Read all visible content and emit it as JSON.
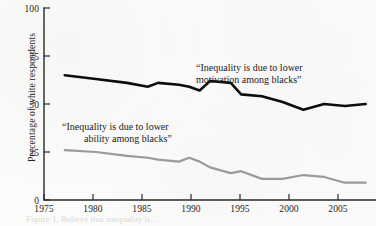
{
  "figure": {
    "ylabel": "Percentage of white respondents",
    "caption": "Figure 1. Believe that inequality is..."
  },
  "chart_data": {
    "type": "line",
    "title": "",
    "xlabel": "",
    "ylabel": "Percentage of white respondents",
    "xlim": [
      1975,
      2007
    ],
    "ylim": [
      0,
      100
    ],
    "grid": false,
    "legend_position": "inline-annotation",
    "xticks": [
      1975,
      1980,
      1985,
      1990,
      1995,
      2000,
      2005
    ],
    "xtick_labels": [
      "1975",
      "1980",
      "1985",
      "1990",
      "1995",
      "2000",
      "2005"
    ],
    "yticks": [
      0,
      25,
      50,
      75,
      100
    ],
    "ytick_labels": [
      "0",
      "25",
      "50",
      "75",
      "100"
    ],
    "series": [
      {
        "name": "“Inequality is due to lower motivation among blacks”",
        "annotation": "“Inequality is due to lower\nmotivation among blacks”",
        "color": "#0d0d0d",
        "width": 2.6,
        "x": [
          1977,
          1980,
          1983,
          1985,
          1986,
          1988,
          1989,
          1990,
          1991,
          1993,
          1994,
          1996,
          1998,
          2000,
          2002,
          2004,
          2006
        ],
        "y": [
          65,
          63,
          61,
          59,
          61,
          60,
          59,
          57,
          62,
          61,
          55,
          54,
          51,
          47,
          50,
          49,
          50
        ]
      },
      {
        "name": "“Inequality is due to lower ability among blacks”",
        "annotation": "“Inequality is due to lower\nability among blacks”",
        "color": "#9a9a9a",
        "width": 2.2,
        "x": [
          1977,
          1980,
          1983,
          1985,
          1986,
          1988,
          1989,
          1990,
          1991,
          1993,
          1994,
          1996,
          1998,
          2000,
          2002,
          2004,
          2006
        ],
        "y": [
          26,
          25,
          23,
          22,
          21,
          20,
          22,
          20,
          17,
          14,
          15,
          11,
          11,
          13,
          12,
          9,
          9
        ]
      }
    ],
    "annotations": [
      {
        "id": "motivation",
        "line1": "“Inequality is due to lower",
        "line2": "motivation among blacks”",
        "x": 196,
        "y": 71
      },
      {
        "id": "ability",
        "line1": "“Inequality is due to lower",
        "line2": "ability among blacks”",
        "x": 62,
        "y": 130
      }
    ]
  }
}
